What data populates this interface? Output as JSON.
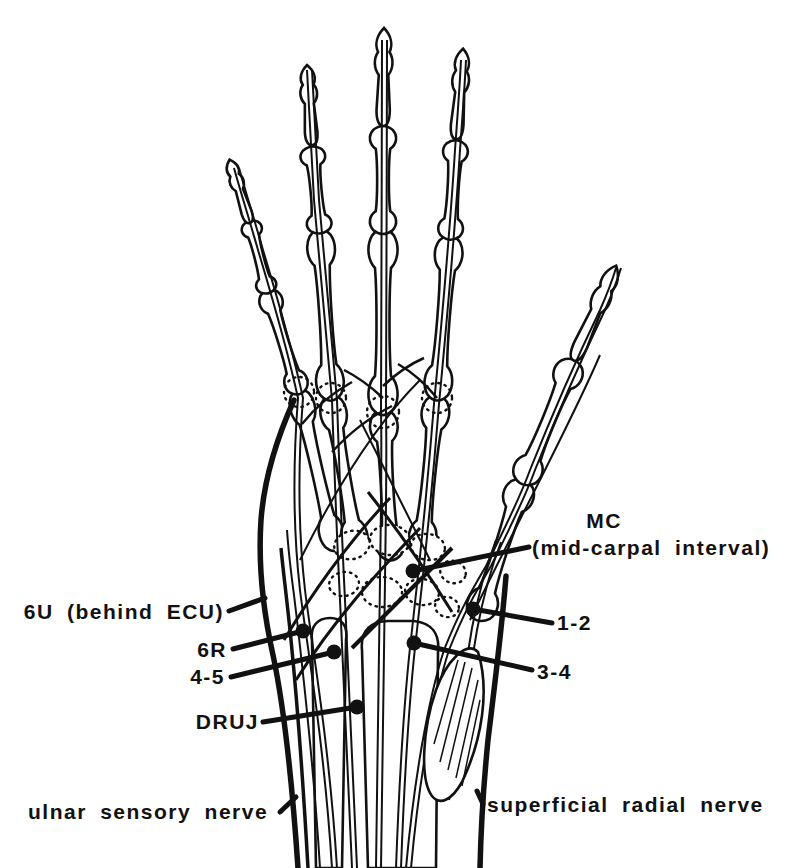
{
  "figure": {
    "colors": {
      "ink": "#111111",
      "paper": "#ffffff"
    },
    "markers": [
      {
        "id": "6u",
        "label": "6U (behind ECU)"
      },
      {
        "id": "6r",
        "label": "6R"
      },
      {
        "id": "4-5",
        "label": "4-5"
      },
      {
        "id": "druj",
        "label": "DRUJ"
      },
      {
        "id": "mc",
        "label": "MC",
        "sublabel": "(mid-carpal interval)"
      },
      {
        "id": "1-2",
        "label": "1-2"
      },
      {
        "id": "3-4",
        "label": "3-4"
      },
      {
        "id": "ulnar-sensory-nerve",
        "label": "ulnar sensory nerve"
      },
      {
        "id": "superficial-radial-nerve",
        "label": "superficial radial nerve"
      }
    ]
  }
}
